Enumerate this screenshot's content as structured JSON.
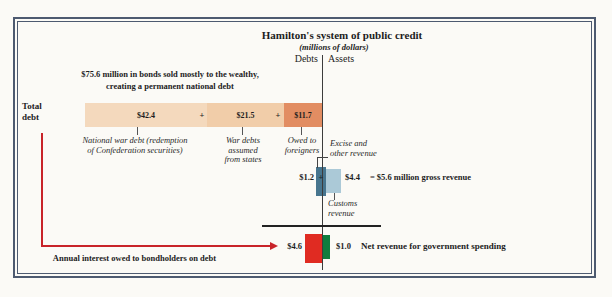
{
  "header": {
    "title": "Hamilton's system of public credit",
    "subtitle": "(millions of dollars)",
    "debts_label": "Debts",
    "assets_label": "Assets"
  },
  "intro": {
    "line1": "$75.6 million in bonds sold mostly to the wealthy,",
    "line2": "creating a permanent national debt"
  },
  "total_debt": {
    "label_line1": "Total",
    "label_line2": "debt",
    "plus": "+",
    "segments": [
      {
        "value": "$42.4",
        "caption_line1": "National war debt (redemption",
        "caption_line2": "of Confederation securities)",
        "color": "#f4d9bd"
      },
      {
        "value": "$21.5",
        "caption_line1": "War debts",
        "caption_line2": "assumed",
        "caption_line3": "from states",
        "color": "#f1cda9"
      },
      {
        "value": "$11.7",
        "caption_line1": "Owed to",
        "caption_line2": "foreigners",
        "color": "#e28d62"
      }
    ]
  },
  "gross_revenue": {
    "excise_caption_line1": "Excise and",
    "excise_caption_line2": "other revenue",
    "excise_value": "$1.2",
    "plus": "+",
    "customs_value": "$4.4",
    "total_text": "= $5.6 million gross revenue",
    "customs_caption_line1": "Customs",
    "customs_caption_line2": "revenue",
    "excise_color": "#47758e",
    "customs_color": "#abc9d7"
  },
  "net_revenue": {
    "interest_value": "$4.6",
    "net_value": "$1.0",
    "net_caption": "Net revenue for government spending",
    "interest_caption": "Annual interest owed to bondholders on debt",
    "interest_color": "#e02b22",
    "net_color": "#107c3e",
    "arrow_color": "#c82329"
  },
  "chart_data": {
    "type": "bar",
    "title": "Hamilton's system of public credit",
    "units": "millions of dollars",
    "columns": [
      "Debts",
      "Assets"
    ],
    "debt_note": "$75.6 million in bonds sold mostly to the wealthy, creating a permanent national debt",
    "debt_total": 75.6,
    "debt_segments": [
      {
        "label": "National war debt (redemption of Confederation securities)",
        "value": 42.4
      },
      {
        "label": "War debts assumed from states",
        "value": 21.5
      },
      {
        "label": "Owed to foreigners",
        "value": 11.7
      }
    ],
    "gross_revenue_total": 5.6,
    "gross_revenue_segments": [
      {
        "label": "Excise and other revenue",
        "value": 1.2
      },
      {
        "label": "Customs revenue",
        "value": 4.4
      }
    ],
    "annual_interest_on_debt": 4.6,
    "net_revenue_for_spending": 1.0,
    "interest_note": "Annual interest owed to bondholders on debt",
    "net_note": "Net revenue for government spending"
  }
}
